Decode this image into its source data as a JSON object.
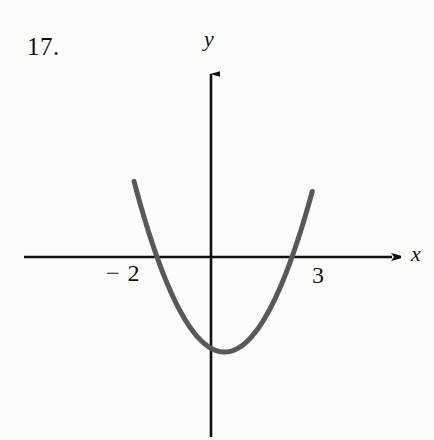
{
  "figure": {
    "problem_number": "17.",
    "background_color": "#fcfcfb",
    "axis_color": "#101010",
    "curve_color": "#585858",
    "axes": {
      "x_label": "x",
      "y_label": "y",
      "x_axis_name": "x-axis",
      "y_axis_name": "y-axis"
    },
    "tick_labels": {
      "left": "− 2",
      "right": "3"
    }
  },
  "chart_data": {
    "type": "line",
    "title": "",
    "subtitle": "",
    "xlabel": "x",
    "ylabel": "y",
    "grid": false,
    "legend": null,
    "annotations": [
      "17."
    ],
    "x_tick_labels": [
      "− 2",
      "3"
    ],
    "x_ticks": [
      -2,
      3
    ],
    "y_ticks": [],
    "y_tick_labels": [],
    "xlim": [
      -3.6,
      4.6
    ],
    "ylim": [
      -4.6,
      4.6
    ],
    "origin_px": [
      211,
      257
    ],
    "x_axis_extent_px": [
      24,
      400
    ],
    "y_axis_extent_px": [
      62,
      437
    ],
    "series": [
      {
        "name": "parabola",
        "kind": "quadratic",
        "roots": [
          -2,
          3
        ],
        "vertex": [
          0.5,
          -6.25
        ],
        "equation": "y = (x + 2)(x - 3)",
        "color": "#585858",
        "linewidth_px": 5,
        "x": [
          -2.85,
          -2.5,
          -2.0,
          -1.5,
          -1.0,
          -0.5,
          0.0,
          0.5,
          1.0,
          1.5,
          2.0,
          2.5,
          3.0,
          3.5,
          3.75
        ],
        "y": [
          5.5,
          2.75,
          0.0,
          -2.25,
          -4.0,
          -5.25,
          -6.0,
          -6.25,
          -6.0,
          -5.25,
          -4.0,
          -2.25,
          0.0,
          2.75,
          4.3
        ],
        "px_points": [
          [
            127,
            160
          ],
          [
            150,
            257
          ],
          [
            180,
            318
          ],
          [
            200,
            344
          ],
          [
            215,
            352
          ],
          [
            233,
            345
          ],
          [
            258,
            316
          ],
          [
            285,
            257
          ],
          [
            302,
            162
          ]
        ]
      }
    ]
  }
}
